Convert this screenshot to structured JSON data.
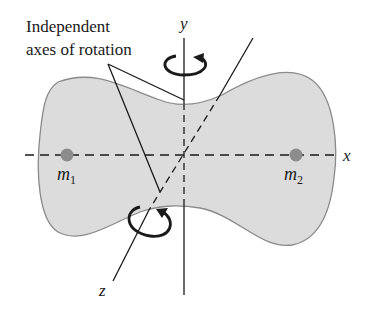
{
  "figure": {
    "annotation": {
      "line1": "Independent",
      "line2": "axes of rotation"
    },
    "axes": {
      "x_label": "x",
      "y_label": "y",
      "z_label": "z"
    },
    "masses": [
      {
        "label": "m",
        "subscript": "1"
      },
      {
        "label": "m",
        "subscript": "2"
      }
    ],
    "colors": {
      "body_fill": "#dcdcdc",
      "body_outline": "#8a8a8a",
      "mass_dot": "#8c8c8c",
      "line": "#1a1a1a"
    }
  }
}
